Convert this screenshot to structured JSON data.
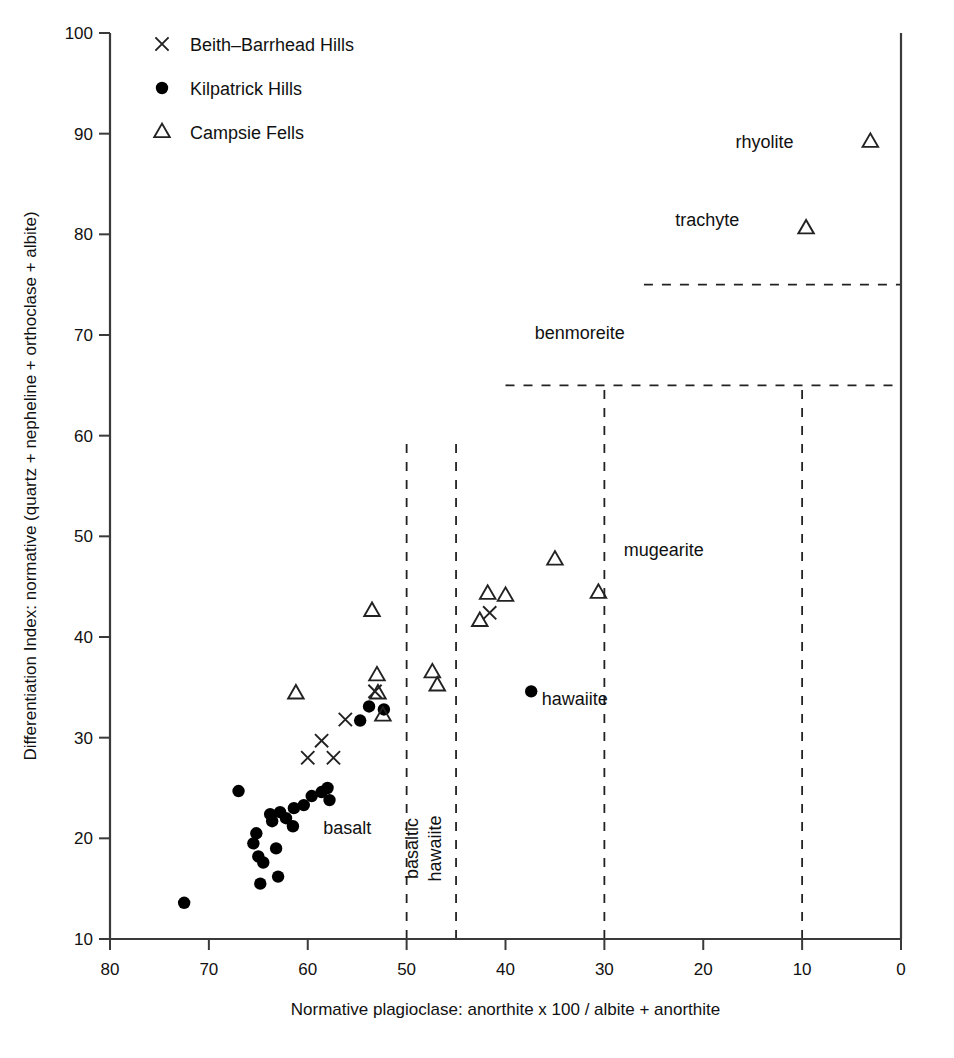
{
  "chart_data": {
    "type": "scatter",
    "title": "",
    "xlabel": "Normative plagioclase: anorthite x 100 / albite + anorthite",
    "ylabel": "Differentiation Index: normative (quartz + nepheline + orthoclase + albite)",
    "xlim": [
      80,
      0
    ],
    "ylim": [
      10,
      100
    ],
    "x_reversed": true,
    "grid": false,
    "xticks": [
      80,
      70,
      60,
      50,
      40,
      30,
      20,
      10,
      0
    ],
    "yticks": [
      10,
      20,
      30,
      40,
      50,
      60,
      70,
      80,
      90,
      100
    ],
    "legend_position": "top-left",
    "series": [
      {
        "name": "Beith-Barrhead Hills",
        "marker": "cross",
        "points": [
          [
            60.0,
            28.0
          ],
          [
            58.6,
            29.7
          ],
          [
            57.4,
            28.0
          ],
          [
            56.2,
            31.8
          ],
          [
            53.2,
            34.6
          ],
          [
            41.6,
            42.4
          ]
        ]
      },
      {
        "name": "Kilpatrick Hills",
        "marker": "circle",
        "points": [
          [
            72.5,
            13.6
          ],
          [
            67.0,
            24.7
          ],
          [
            65.5,
            19.5
          ],
          [
            65.2,
            20.5
          ],
          [
            65.0,
            18.2
          ],
          [
            64.8,
            15.5
          ],
          [
            64.5,
            17.6
          ],
          [
            63.8,
            22.4
          ],
          [
            63.6,
            21.7
          ],
          [
            63.2,
            19.0
          ],
          [
            63.0,
            16.2
          ],
          [
            62.8,
            22.6
          ],
          [
            62.2,
            22.0
          ],
          [
            61.5,
            21.2
          ],
          [
            61.4,
            23.0
          ],
          [
            60.4,
            23.3
          ],
          [
            59.6,
            24.2
          ],
          [
            58.6,
            24.6
          ],
          [
            58.0,
            25.0
          ],
          [
            57.8,
            23.8
          ],
          [
            54.7,
            31.7
          ],
          [
            53.8,
            33.1
          ],
          [
            52.3,
            32.8
          ],
          [
            37.4,
            34.6
          ]
        ]
      },
      {
        "name": "Campsie Fells",
        "marker": "triangle",
        "points": [
          [
            61.2,
            34.4
          ],
          [
            53.5,
            42.6
          ],
          [
            53.0,
            36.2
          ],
          [
            52.9,
            34.4
          ],
          [
            52.4,
            32.2
          ],
          [
            47.4,
            36.5
          ],
          [
            46.9,
            35.2
          ],
          [
            42.6,
            41.6
          ],
          [
            41.8,
            44.3
          ],
          [
            40.0,
            44.1
          ],
          [
            35.0,
            47.7
          ],
          [
            30.6,
            44.4
          ],
          [
            9.6,
            80.6
          ],
          [
            3.1,
            89.2
          ]
        ]
      }
    ],
    "field_labels": [
      {
        "text": "basalt",
        "x": 56.0,
        "y": 20.4,
        "rotation": 0
      },
      {
        "text": "basaltic",
        "x": 48.8,
        "y": 19.0,
        "rotation": -90
      },
      {
        "text": "hawaiite",
        "x": 46.5,
        "y": 19.0,
        "rotation": -90
      },
      {
        "text": "hawaiite",
        "x": 33.0,
        "y": 33.2,
        "rotation": 0
      },
      {
        "text": "mugearite",
        "x": 24.0,
        "y": 48.0,
        "rotation": 0
      },
      {
        "text": "benmoreite",
        "x": 32.5,
        "y": 69.6,
        "rotation": 0
      },
      {
        "text": "trachyte",
        "x": 19.6,
        "y": 80.8,
        "rotation": 0
      },
      {
        "text": "rhyolite",
        "x": 13.8,
        "y": 88.6,
        "rotation": 0
      }
    ],
    "field_boundaries": [
      {
        "orientation": "vertical",
        "x": 50,
        "y_from": 10,
        "y_to": 60
      },
      {
        "orientation": "vertical",
        "x": 45,
        "y_from": 10,
        "y_to": 60
      },
      {
        "orientation": "vertical",
        "x": 30,
        "y_from": 10,
        "y_to": 65
      },
      {
        "orientation": "vertical",
        "x": 10,
        "y_from": 10,
        "y_to": 65
      },
      {
        "orientation": "horizontal",
        "y": 65,
        "x_from": 40,
        "x_to": 0
      },
      {
        "orientation": "horizontal",
        "y": 75,
        "x_from": 26,
        "x_to": 0
      }
    ]
  },
  "legend": {
    "entries": [
      {
        "label": "Beith–Barrhead Hills",
        "marker": "cross"
      },
      {
        "label": "Kilpatrick Hills",
        "marker": "circle"
      },
      {
        "label": "Campsie Fells",
        "marker": "triangle"
      }
    ]
  },
  "colors": {
    "axis": "#3a3a3a",
    "marker": "#222222",
    "text": "#111111",
    "background": "#ffffff"
  }
}
